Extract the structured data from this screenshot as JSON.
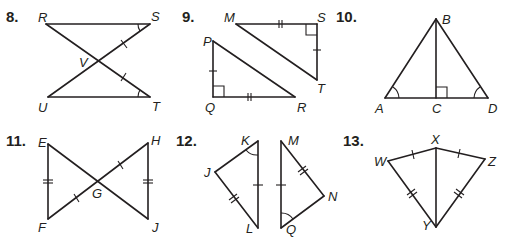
{
  "problems": [
    {
      "number": "8.",
      "shape": "two triangles sharing vertex V (crossing segments)",
      "vertices": {
        "R": "R",
        "S": "S",
        "V": "V",
        "U": "U",
        "T": "T"
      },
      "markings": [
        "SV ≅ TV (single tick)",
        "∠S ≅ ∠T (single arc)"
      ]
    },
    {
      "number": "9.",
      "shape": "two right triangles",
      "vertices": {
        "M": "M",
        "S": "S",
        "T": "T",
        "P": "P",
        "Q": "Q",
        "R": "R"
      },
      "markings": [
        "MS ≅ QR (double tick)",
        "ST ≅ PQ (single tick)",
        "right angles at S and Q"
      ]
    },
    {
      "number": "10.",
      "shape": "triangle ABD with altitude BC",
      "vertices": {
        "A": "A",
        "B": "B",
        "C": "C",
        "D": "D"
      },
      "markings": [
        "∠A ≅ ∠D (single arc)",
        "right angle at C"
      ]
    },
    {
      "number": "11.",
      "shape": "bowtie triangles sharing vertex G",
      "vertices": {
        "E": "E",
        "F": "F",
        "G": "G",
        "H": "H",
        "J": "J"
      },
      "markings": [
        "EF ≅ HJ (double tick)",
        "FG ≅ GH (single tick)"
      ]
    },
    {
      "number": "12.",
      "shape": "two separate triangles",
      "vertices": {
        "K": "K",
        "J": "J",
        "L": "L",
        "M": "M",
        "N": "N",
        "Q": "Q"
      },
      "markings": [
        "KL ≅ MQ (single tick)",
        "JL ≅ MN (double tick)",
        "∠K ≅ ∠Q (single arc)"
      ]
    },
    {
      "number": "13.",
      "shape": "kite WXZY with diagonal XY",
      "vertices": {
        "W": "W",
        "X": "X",
        "Y": "Y",
        "Z": "Z"
      },
      "markings": [
        "WX ≅ XZ (single tick)",
        "WY ≅ ZY (double tick)"
      ]
    }
  ]
}
